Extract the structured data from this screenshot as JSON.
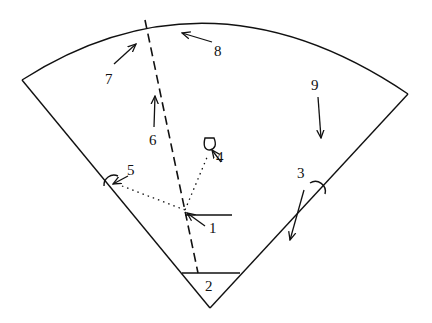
{
  "diagram": {
    "type": "sector-with-labeled-arrows",
    "stroke_color": "#111111",
    "background": "#ffffff",
    "labels": {
      "l1": "1",
      "l2": "2",
      "l3": "3",
      "l4": "4",
      "l5": "5",
      "l6": "6",
      "l7": "7",
      "l8": "8",
      "l9": "9"
    }
  }
}
